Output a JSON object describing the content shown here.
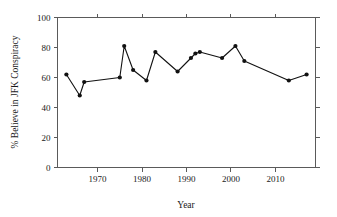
{
  "chart_data": {
    "type": "line",
    "title": "",
    "xlabel": "Year",
    "ylabel": "% Believe in JFK Conspiracy",
    "xlim": [
      1961,
      2019
    ],
    "ylim": [
      0,
      100
    ],
    "xticks": [
      1970,
      1980,
      1990,
      2000,
      2010
    ],
    "xtick_labels": [
      "1970",
      "1980",
      "1990",
      "2000",
      "2010"
    ],
    "yticks": [
      0,
      20,
      40,
      60,
      80,
      100
    ],
    "ytick_labels": [
      "0",
      "20",
      "40",
      "60",
      "80",
      "100"
    ],
    "grid": false,
    "legend": false,
    "marker": "filled-circle",
    "line_color": "#111111",
    "marker_color": "#111111",
    "axis_color": "#5a5a5a",
    "background_color": "#ffffff",
    "series": [
      {
        "name": "% Believe in JFK Conspiracy",
        "x": [
          1963,
          1966,
          1967,
          1975,
          1976,
          1978,
          1981,
          1983,
          1988,
          1991,
          1992,
          1993,
          1998,
          2001,
          2003,
          2013,
          2017
        ],
        "y": [
          62,
          48,
          57,
          60,
          81,
          65,
          58,
          77,
          64,
          73,
          76,
          77,
          73,
          81,
          71,
          58,
          62
        ]
      }
    ]
  },
  "figure": {
    "plot_frame": "box-with-ticks",
    "tick_direction": "outward"
  }
}
